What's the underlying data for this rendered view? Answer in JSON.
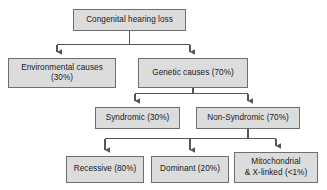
{
  "diagram": {
    "title_text": "Congenital hearing loss",
    "type": "flowchart",
    "background_color": "#ffffff",
    "node_fill_color": "#dcdcdc",
    "node_border_color": "#6e6e6e",
    "connector_color": "#555555",
    "nodes": [
      {
        "id": "root",
        "label": "Congenital hearing loss",
        "level": 0
      },
      {
        "id": "environ",
        "label": "Environmental causes\n(30%)",
        "level": 1
      },
      {
        "id": "genetic",
        "label": "Genetic causes (70%)",
        "level": 1
      },
      {
        "id": "syndromic",
        "label": "Syndromic (30%)",
        "level": 2
      },
      {
        "id": "nonsyn",
        "label": "Non-Syndromic (70%)",
        "level": 2
      },
      {
        "id": "recessive",
        "label": "Recessive (80%)",
        "level": 3
      },
      {
        "id": "dominant",
        "label": "Dominant (20%)",
        "level": 3
      },
      {
        "id": "mito",
        "label": "Mitochondrial\n& X-linked (<1%)",
        "level": 3
      }
    ],
    "edges": [
      {
        "from": "root",
        "to": "environ"
      },
      {
        "from": "root",
        "to": "genetic"
      },
      {
        "from": "genetic",
        "to": "syndromic"
      },
      {
        "from": "genetic",
        "to": "nonsyn"
      },
      {
        "from": "nonsyn",
        "to": "recessive"
      },
      {
        "from": "nonsyn",
        "to": "dominant"
      },
      {
        "from": "nonsyn",
        "to": "mito"
      }
    ]
  }
}
